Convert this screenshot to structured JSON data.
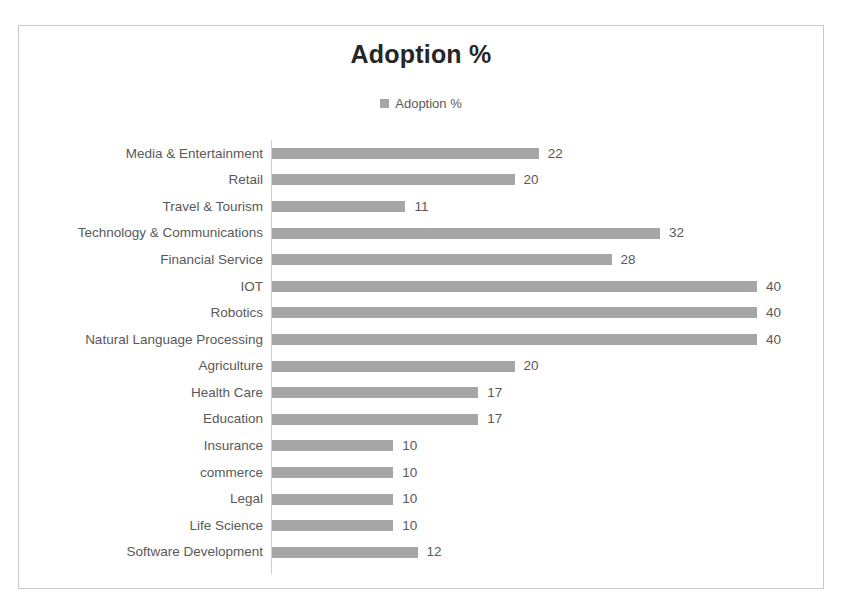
{
  "chart_data": {
    "type": "bar",
    "orientation": "horizontal",
    "title": "Adoption %",
    "xlabel": "",
    "ylabel": "",
    "grid": false,
    "legend_position": "top",
    "legend": [
      "Adoption %"
    ],
    "series_name": "Adoption %",
    "bar_color": "#a6a6a6",
    "axis_color": "#cfcfcf",
    "label_color": "#595959",
    "title_color": "#262626",
    "xlim": [
      0,
      40
    ],
    "categories": [
      "Media & Entertainment",
      "Retail",
      "Travel & Tourism",
      "Technology & Communications",
      "Financial Service",
      "IOT",
      "Robotics",
      "Natural Language Processing",
      "Agriculture",
      "Health Care",
      "Education",
      "Insurance",
      "commerce",
      "Legal",
      "Life Science",
      "Software Development"
    ],
    "values": [
      22,
      20,
      11,
      32,
      28,
      40,
      40,
      40,
      20,
      17,
      17,
      10,
      10,
      10,
      10,
      12
    ],
    "data_labels": [
      "22",
      "20",
      "11",
      "32",
      "28",
      "40",
      "40",
      "40",
      "20",
      "17",
      "17",
      "10",
      "10",
      "10",
      "10",
      "12"
    ]
  }
}
